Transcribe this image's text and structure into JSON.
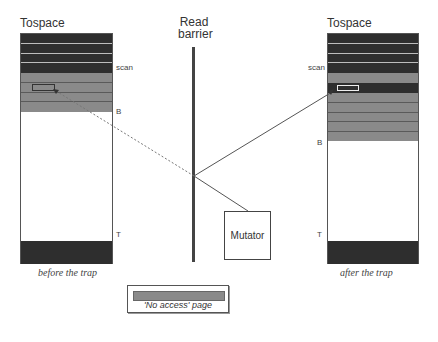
{
  "diagram": {
    "left_space": {
      "title": "Tospace",
      "scan_label": "scan",
      "b_label": "B",
      "t_label": "T",
      "caption": "before the trap"
    },
    "right_space": {
      "title": "Tospace",
      "scan_label": "scan",
      "b_label": "B",
      "t_label": "T",
      "caption": "after the trap"
    },
    "barrier": {
      "line1": "Read",
      "line2": "barrier"
    },
    "mutator": {
      "label": "Mutator"
    },
    "legend": {
      "label": "'No access' page",
      "swatch_color": "#8a8a8a"
    },
    "colors": {
      "scanned": "#2e2e2e",
      "no_access": "#8a8a8a",
      "unallocated": "#ffffff"
    }
  }
}
